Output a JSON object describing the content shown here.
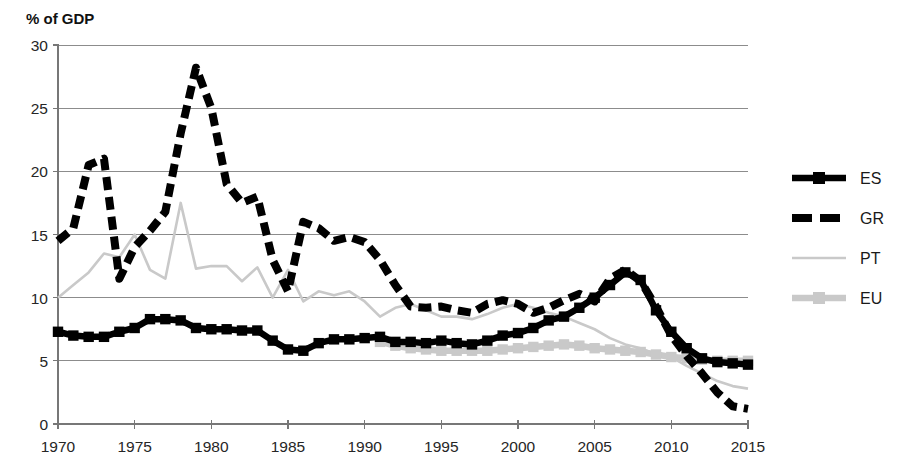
{
  "chart_data": {
    "type": "line",
    "title": "",
    "subtitle": "",
    "ylabel": "% of GDP",
    "xlabel": "",
    "ylim": [
      0,
      30
    ],
    "xlim": [
      1970,
      2015
    ],
    "yticks": [
      "0",
      "5",
      "10",
      "15",
      "20",
      "25",
      "30"
    ],
    "ytick_values": [
      0,
      5,
      10,
      15,
      20,
      25,
      30
    ],
    "xticks": [
      "1970",
      "1975",
      "1980",
      "1985",
      "1990",
      "1995",
      "2000",
      "2005",
      "2010",
      "2015"
    ],
    "xtick_values": [
      1970,
      1975,
      1980,
      1985,
      1990,
      1995,
      2000,
      2005,
      2010,
      2015
    ],
    "grid": "horizontal",
    "legend_position": "right",
    "x": [
      1970,
      1971,
      1972,
      1973,
      1974,
      1975,
      1976,
      1977,
      1978,
      1979,
      1980,
      1981,
      1982,
      1983,
      1984,
      1985,
      1986,
      1987,
      1988,
      1989,
      1990,
      1991,
      1992,
      1993,
      1994,
      1995,
      1996,
      1997,
      1998,
      1999,
      2000,
      2001,
      2002,
      2003,
      2004,
      2005,
      2006,
      2007,
      2008,
      2009,
      2010,
      2011,
      2012,
      2013,
      2014,
      2015
    ],
    "series": [
      {
        "name": "ES",
        "color": "#000000",
        "style": "solid",
        "marker": "square",
        "x": [
          1970,
          1971,
          1972,
          1973,
          1974,
          1975,
          1976,
          1977,
          1978,
          1979,
          1980,
          1981,
          1982,
          1983,
          1984,
          1985,
          1986,
          1987,
          1988,
          1989,
          1990,
          1991,
          1992,
          1993,
          1994,
          1995,
          1996,
          1997,
          1998,
          1999,
          2000,
          2001,
          2002,
          2003,
          2004,
          2005,
          2006,
          2007,
          2008,
          2009,
          2010,
          2011,
          2012,
          2013,
          2014,
          2015
        ],
        "values": [
          7.3,
          7.0,
          6.9,
          6.9,
          7.3,
          7.6,
          8.3,
          8.3,
          8.2,
          7.6,
          7.5,
          7.5,
          7.4,
          7.4,
          6.6,
          5.9,
          5.8,
          6.4,
          6.7,
          6.7,
          6.8,
          6.9,
          6.5,
          6.5,
          6.4,
          6.6,
          6.4,
          6.3,
          6.6,
          7.0,
          7.2,
          7.6,
          8.2,
          8.5,
          9.2,
          10.0,
          11.0,
          12.0,
          11.4,
          9.0,
          7.3,
          6.0,
          5.2,
          4.9,
          4.8,
          4.7
        ]
      },
      {
        "name": "GR",
        "color": "#000000",
        "style": "dashed",
        "marker": "none",
        "x": [
          1970,
          1971,
          1972,
          1973,
          1974,
          1975,
          1976,
          1977,
          1978,
          1979,
          1980,
          1981,
          1982,
          1983,
          1984,
          1985,
          1986,
          1987,
          1988,
          1989,
          1990,
          1991,
          1992,
          1993,
          1994,
          1995,
          1996,
          1997,
          1998,
          1999,
          2000,
          2001,
          2002,
          2003,
          2004,
          2005,
          2006,
          2007,
          2008,
          2009,
          2010,
          2011,
          2012,
          2013,
          2014,
          2015
        ],
        "values": [
          14.5,
          15.5,
          20.5,
          21.0,
          11.5,
          14.0,
          15.3,
          16.8,
          23.0,
          28.2,
          25.0,
          19.0,
          17.5,
          18.0,
          13.0,
          10.5,
          16.0,
          15.5,
          14.5,
          14.8,
          14.4,
          13.0,
          11.0,
          9.3,
          9.2,
          9.3,
          9.0,
          8.8,
          9.5,
          9.8,
          9.5,
          8.8,
          9.2,
          9.8,
          10.3,
          9.7,
          11.5,
          12.2,
          11.3,
          9.3,
          7.0,
          5.4,
          4.0,
          2.5,
          1.4,
          1.2
        ]
      },
      {
        "name": "PT",
        "color": "#c9c9c9",
        "style": "solid-thin",
        "marker": "none",
        "x": [
          1970,
          1971,
          1972,
          1973,
          1974,
          1975,
          1976,
          1977,
          1978,
          1979,
          1980,
          1981,
          1982,
          1983,
          1984,
          1985,
          1986,
          1987,
          1988,
          1989,
          1990,
          1991,
          1992,
          1993,
          1994,
          1995,
          1996,
          1997,
          1998,
          1999,
          2000,
          2001,
          2002,
          2003,
          2004,
          2005,
          2006,
          2007,
          2008,
          2009,
          2010,
          2011,
          2012,
          2013,
          2014,
          2015
        ],
        "values": [
          10.0,
          11.0,
          12.0,
          13.5,
          13.2,
          15.0,
          12.2,
          11.5,
          17.5,
          12.3,
          12.5,
          12.5,
          11.3,
          12.4,
          10.0,
          12.2,
          9.7,
          10.5,
          10.2,
          10.5,
          9.7,
          8.5,
          9.2,
          9.5,
          9.0,
          8.5,
          8.5,
          8.3,
          8.7,
          9.2,
          9.5,
          9.2,
          8.8,
          8.5,
          8.0,
          7.5,
          6.8,
          6.3,
          6.0,
          5.5,
          5.3,
          4.6,
          4.0,
          3.4,
          3.0,
          2.8
        ]
      },
      {
        "name": "EU",
        "color": "#c9c9c9",
        "style": "solid",
        "marker": "square",
        "x": [
          1991,
          1992,
          1993,
          1994,
          1995,
          1996,
          1997,
          1998,
          1999,
          2000,
          2001,
          2002,
          2003,
          2004,
          2005,
          2006,
          2007,
          2008,
          2009,
          2010,
          2011,
          2012,
          2013,
          2014,
          2015
        ],
        "values": [
          6.5,
          6.2,
          6.0,
          5.9,
          5.8,
          5.8,
          5.8,
          5.8,
          5.9,
          6.0,
          6.1,
          6.2,
          6.3,
          6.2,
          6.0,
          5.9,
          5.8,
          5.7,
          5.5,
          5.3,
          5.2,
          5.1,
          5.0,
          5.0,
          5.0
        ]
      }
    ],
    "legend": [
      {
        "label": "ES",
        "color": "#000000",
        "style": "solid",
        "marker": "square"
      },
      {
        "label": "GR",
        "color": "#000000",
        "style": "dashed",
        "marker": "none"
      },
      {
        "label": "PT",
        "color": "#c9c9c9",
        "style": "solid-thin",
        "marker": "none"
      },
      {
        "label": "EU",
        "color": "#c9c9c9",
        "style": "solid",
        "marker": "square"
      }
    ]
  }
}
